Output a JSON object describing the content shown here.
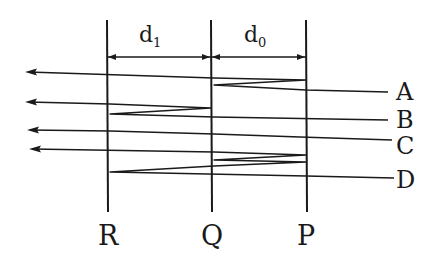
{
  "diagram": {
    "ink_color": "#1a1a1a",
    "plates": [
      {
        "name": "R",
        "x": 107
      },
      {
        "name": "Q",
        "x": 211
      },
      {
        "name": "P",
        "x": 306
      }
    ],
    "dimensions": [
      {
        "label": "d",
        "subscript": "1",
        "from": "R",
        "to": "Q"
      },
      {
        "label": "d",
        "subscript": "0",
        "from": "Q",
        "to": "P"
      }
    ],
    "rays": [
      {
        "label": "A",
        "label_y": 93,
        "path": [
          [
            388,
            92
          ],
          [
            306,
            90
          ],
          [
            214,
            85
          ],
          [
            306,
            80
          ],
          [
            214,
            78
          ],
          [
            28,
            72
          ]
        ]
      },
      {
        "label": "B",
        "label_y": 122,
        "path": [
          [
            388,
            120
          ],
          [
            214,
            117
          ],
          [
            110,
            114
          ],
          [
            211,
            108
          ],
          [
            110,
            104
          ],
          [
            28,
            102
          ]
        ]
      },
      {
        "label": "C",
        "label_y": 145,
        "path": [
          [
            392,
            140
          ],
          [
            300,
            137
          ],
          [
            214,
            134
          ],
          [
            110,
            131
          ],
          [
            30,
            130
          ]
        ]
      },
      {
        "label": "D",
        "label_y": 181,
        "path": [
          [
            394,
            178
          ],
          [
            306,
            176
          ],
          [
            110,
            172
          ],
          [
            214,
            166
          ],
          [
            306,
            162
          ],
          [
            214,
            160
          ],
          [
            306,
            155
          ],
          [
            214,
            152
          ],
          [
            32,
            149
          ]
        ]
      }
    ],
    "plate_labels": [
      "R",
      "Q",
      "P"
    ]
  }
}
